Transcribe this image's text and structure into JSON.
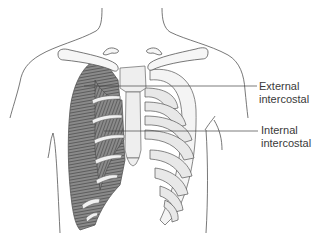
{
  "diagram": {
    "labels": [
      {
        "id": "external",
        "line1": "External",
        "line2": "intercostal"
      },
      {
        "id": "internal",
        "line1": "Internal",
        "line2": "intercostal"
      }
    ],
    "colors": {
      "outline": "#555555",
      "bone_fill": "#f4f4f4",
      "bone_shade": "#dcdcdc",
      "muscle_fill": "#7a7a7a",
      "muscle_stripe": "#3c3c3c",
      "leader_line": "#444444",
      "label_text": "#3a3a3a"
    }
  }
}
